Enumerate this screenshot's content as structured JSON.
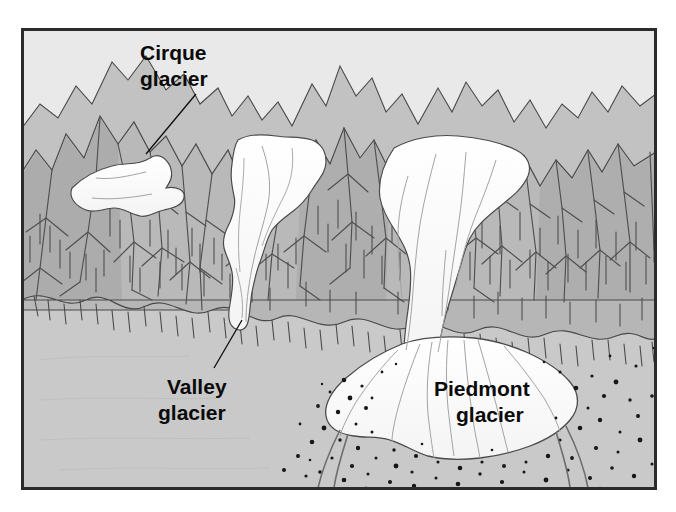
{
  "figure": {
    "name": "glacier-types-block-diagram",
    "frame": {
      "border_color": "#2b2b2b",
      "border_width": 3,
      "x": 21,
      "y": 28,
      "width": 636,
      "height": 462
    }
  },
  "palette": {
    "sky": "#e9e9e9",
    "mountain_light": "#c6c6c6",
    "mountain_mid": "#b4b4b4",
    "mountain_dark": "#a3a3a3",
    "plain": "#c9c9c9",
    "ice": "#fdfdfd",
    "ice_shadow": "#f1f1f1",
    "ink": "#3a3a3a",
    "label_text": "#0a0a0a",
    "till_dots": "#1a1a1a"
  },
  "labels": [
    {
      "id": "cirque",
      "line1": "Cirque",
      "line2": "glacier",
      "x": 196,
      "y": 52,
      "leader": {
        "x1": 196,
        "y1": 92,
        "x2": 144,
        "y2": 152
      }
    },
    {
      "id": "valley",
      "line1": "Valley",
      "line2": "glacier",
      "x": 221,
      "y": 388,
      "leader": {
        "x1": 216,
        "y1": 370,
        "x2": 243,
        "y2": 322
      }
    },
    {
      "id": "piedmont",
      "line1": "Piedmont",
      "line2": "glacier",
      "x": 500,
      "y": 398,
      "leader": null
    }
  ],
  "features": {
    "cirque_glacier": {
      "name": "cirque-glacier-ice",
      "description": "small bowl-shaped ice patch high on the range"
    },
    "valley_glacier": {
      "name": "valley-glacier-ice",
      "description": "narrow ice tongue flowing down a mountain valley"
    },
    "piedmont_glacier": {
      "name": "piedmont-glacier-ice",
      "description": "broad fan-shaped lobe spreading onto the lowland plain"
    },
    "moraine": {
      "name": "moraine-till-stipple",
      "description": "stippled glacial till and outwash around the piedmont lobe"
    },
    "plain": {
      "name": "foreground-plain",
      "description": "flat lowland in front of the mountain front"
    },
    "sky": {
      "name": "sky-background",
      "description": "pale sky above the ridge line"
    }
  }
}
